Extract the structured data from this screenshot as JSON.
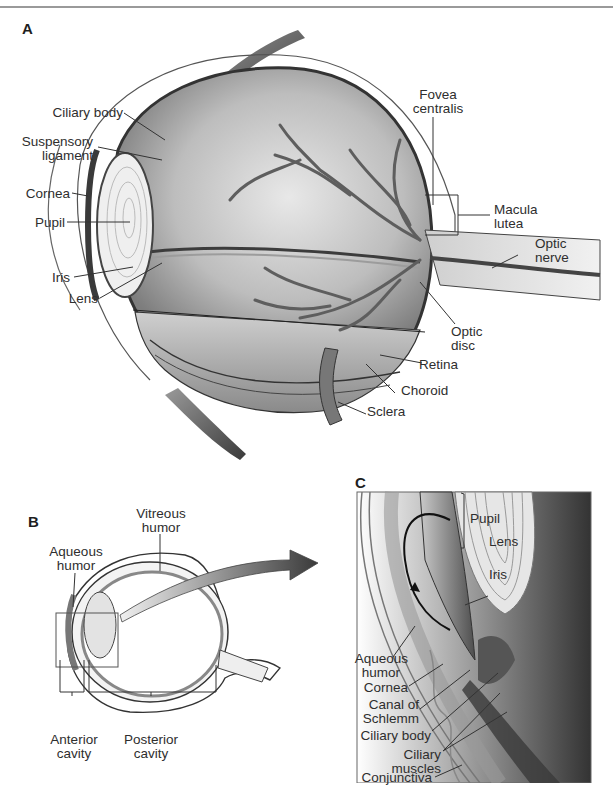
{
  "figure": {
    "panels": [
      {
        "id": "A",
        "letter": "A",
        "description": "Sagittal cutaway of the eyeball",
        "labels": {
          "ciliary_body": "Ciliary body",
          "suspensory_ligament_1": "Suspensory",
          "suspensory_ligament_2": "ligament",
          "cornea": "Cornea",
          "pupil": "Pupil",
          "iris": "Iris",
          "lens": "Lens",
          "fovea_centralis_1": "Fovea",
          "fovea_centralis_2": "centralis",
          "macula_lutea_1": "Macula",
          "macula_lutea_2": "lutea",
          "optic_nerve_1": "Optic",
          "optic_nerve_2": "nerve",
          "optic_disc_1": "Optic",
          "optic_disc_2": "disc",
          "retina": "Retina",
          "choroid": "Choroid",
          "sclera": "Sclera"
        }
      },
      {
        "id": "B",
        "letter": "B",
        "description": "Cavities of the eye",
        "labels": {
          "vitreous_humor_1": "Vitreous",
          "vitreous_humor_2": "humor",
          "aqueous_humor_1": "Aqueous",
          "aqueous_humor_2": "humor",
          "anterior_cavity_1": "Anterior",
          "anterior_cavity_2": "cavity",
          "posterior_cavity_1": "Posterior",
          "posterior_cavity_2": "cavity"
        }
      },
      {
        "id": "C",
        "letter": "C",
        "description": "Enlarged view of anterior eye showing aqueous humor flow",
        "labels": {
          "pupil": "Pupil",
          "lens": "Lens",
          "iris": "Iris",
          "aqueous_humor_1": "Aqueous",
          "aqueous_humor_2": "humor",
          "cornea": "Cornea",
          "canal_of_schlemm_1": "Canal of",
          "canal_of_schlemm_2": "Schlemm",
          "ciliary_body": "Ciliary body",
          "ciliary_muscles_1": "Ciliary",
          "ciliary_muscles_2": "muscles",
          "conjunctiva": "Conjunctiva"
        }
      }
    ]
  }
}
